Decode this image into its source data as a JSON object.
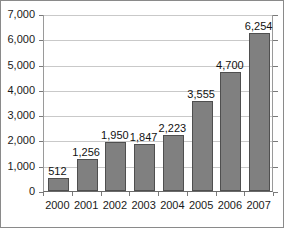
{
  "chart_data": {
    "type": "bar",
    "title": "",
    "subtitle": "",
    "xlabel": "",
    "ylabel": "",
    "categories": [
      "2000",
      "2001",
      "2002",
      "2003",
      "2004",
      "2005",
      "2006",
      "2007"
    ],
    "values": [
      512,
      1256,
      1950,
      1847,
      2223,
      3555,
      4700,
      6254
    ],
    "value_labels": [
      "512",
      "1,256",
      "1,950",
      "1,847",
      "2,223",
      "3,555",
      "4,700",
      "6,254"
    ],
    "ylim": [
      0,
      7000
    ],
    "ytick_values": [
      0,
      1000,
      2000,
      3000,
      4000,
      5000,
      6000,
      7000
    ],
    "ytick_labels": [
      "0",
      "1,000",
      "2,000",
      "3,000",
      "4,000",
      "5,000",
      "6,000",
      "7,000"
    ],
    "grid": true,
    "legend": null,
    "legend_position": "none",
    "series": [
      {
        "name": "",
        "values": [
          512,
          1256,
          1950,
          1847,
          2223,
          3555,
          4700,
          6254
        ]
      }
    ],
    "colors": {
      "bar_fill": "#808080",
      "bar_border": "#4f4f4f",
      "gridline": "#c9c9c9",
      "axis": "#6a6a6a",
      "text": "#1a1a1a",
      "background": "#ffffff",
      "frame": "#8a8a8a"
    }
  }
}
